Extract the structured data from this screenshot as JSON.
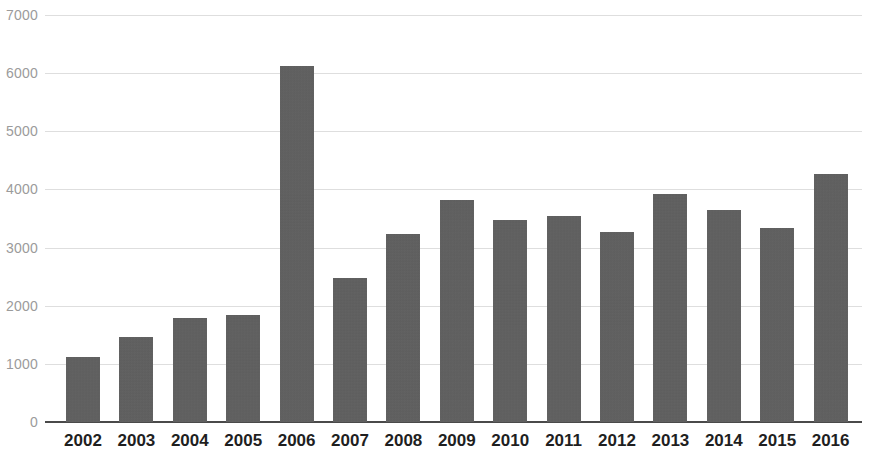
{
  "chart_data": {
    "type": "bar",
    "title": "",
    "subtitle": "",
    "xlabel": "",
    "ylabel": "",
    "categories": [
      "2002",
      "2003",
      "2004",
      "2005",
      "2006",
      "2007",
      "2008",
      "2009",
      "2010",
      "2011",
      "2012",
      "2013",
      "2014",
      "2015",
      "2016"
    ],
    "values": [
      1120,
      1470,
      1790,
      1845,
      6130,
      2480,
      3240,
      3810,
      3480,
      3550,
      3275,
      3930,
      3655,
      3345,
      4260
    ],
    "series": [
      {
        "name": "",
        "values": [
          1120,
          1470,
          1790,
          1845,
          6130,
          2480,
          3240,
          3810,
          3480,
          3550,
          3275,
          3930,
          3655,
          3345,
          4260
        ]
      }
    ],
    "ylim": [
      0,
      7000
    ],
    "y_ticks": [
      0,
      1000,
      2000,
      3000,
      4000,
      5000,
      6000,
      7000
    ],
    "y_tick_labels": [
      "0",
      "1000",
      "2000",
      "3000",
      "4000",
      "5000",
      "6000",
      "7000"
    ],
    "grid": true,
    "grid_axis": "y",
    "legend": false,
    "legend_position": "none",
    "annotations": [],
    "bar_color": "#5f5f5f",
    "gridline_color": "#dedede",
    "axis_line_color": "#4a4a4a",
    "y_label_color": "#9b9b9b",
    "x_label_color": "#1f1f1f",
    "background_color": "#ffffff"
  }
}
